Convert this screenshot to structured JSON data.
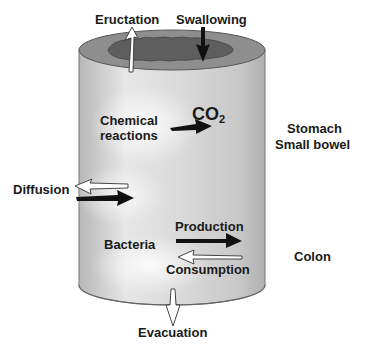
{
  "diagram": {
    "labels": {
      "eructation": "Eructation",
      "swallowing": "Swallowing",
      "chemical_reactions_line1": "Chemical",
      "chemical_reactions_line2": "reactions",
      "co2": "CO",
      "co2_sub": "2",
      "stomach": "Stomach",
      "small_bowel": "Small bowel",
      "diffusion": "Diffusion",
      "production": "Production",
      "bacteria": "Bacteria",
      "consumption": "Consumption",
      "colon": "Colon",
      "evacuation": "Evacuation"
    },
    "colors": {
      "cylinder_side": "#c4c4c4",
      "cylinder_highlight": "#f4f4f4",
      "rim": "#8a8a8a",
      "lumen": "#6a6a6a",
      "dark_arrow": "#111111",
      "light_arrow": "#ffffff"
    }
  }
}
